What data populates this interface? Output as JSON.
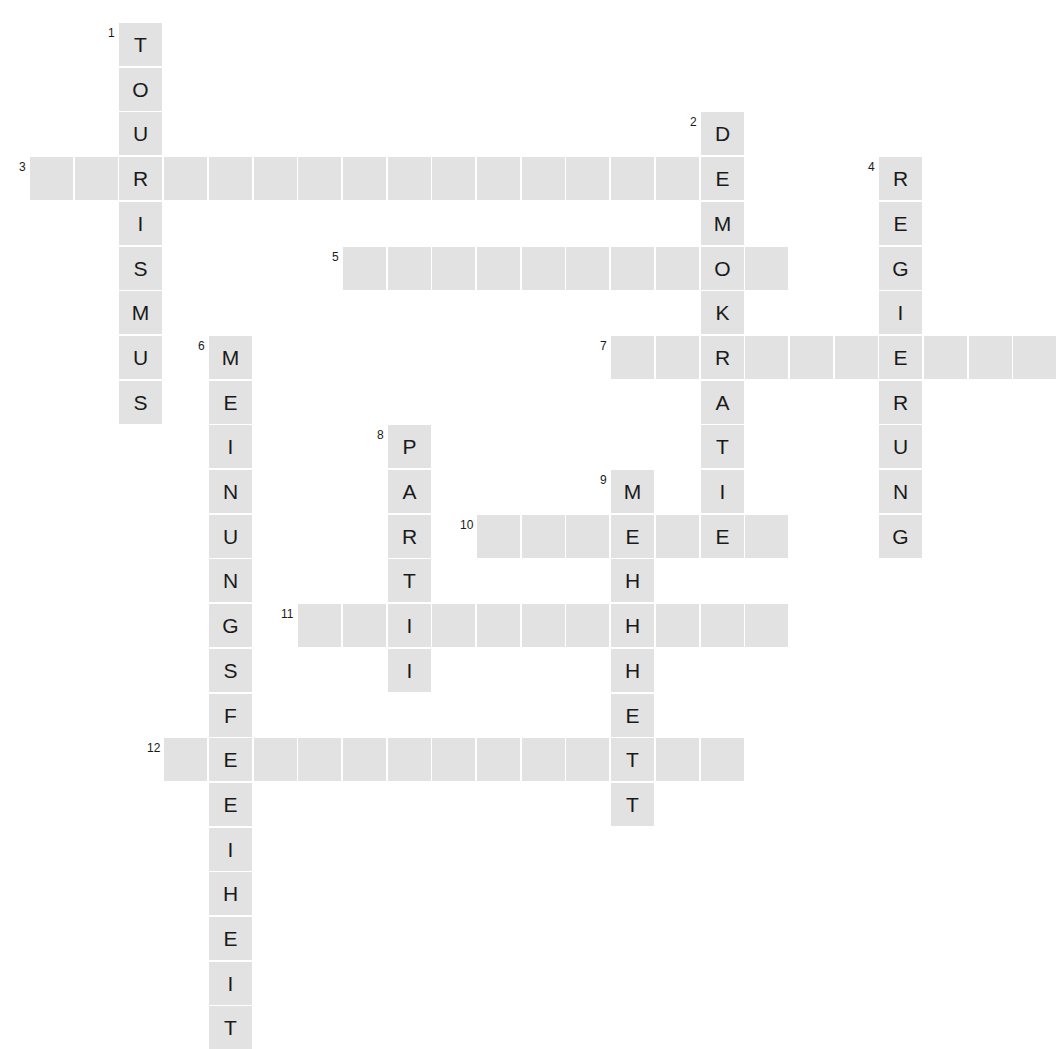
{
  "puzzle": {
    "kind": "crossword-grid",
    "language": "de",
    "cell_size_px": 43,
    "cell_pitch_px": 44.7,
    "origin_x_px": 30,
    "origin_y_px": 23,
    "cell_fill_color": "#e2e2e2",
    "background_color": "#ffffff",
    "letter_color": "#1a1a1a",
    "number_color": "#1a1a1a"
  },
  "entries": [
    {
      "number": "1",
      "direction": "down",
      "row": 0,
      "col": 2,
      "length": 9,
      "letters": [
        "T",
        "O",
        "U",
        "R",
        "I",
        "S",
        "M",
        "U",
        "S"
      ]
    },
    {
      "number": "2",
      "direction": "down",
      "row": 2,
      "col": 15,
      "length": 10,
      "letters": [
        "D",
        "E",
        "M",
        "O",
        "K",
        "R",
        "A",
        "T",
        "I",
        "E"
      ]
    },
    {
      "number": "3",
      "direction": "across",
      "row": 3,
      "col": 0,
      "length": 16,
      "letters": [
        "",
        "",
        "R",
        "",
        "",
        "",
        "",
        "",
        "",
        "",
        "",
        "",
        "",
        "",
        "",
        "E"
      ]
    },
    {
      "number": "4",
      "direction": "down",
      "row": 3,
      "col": 19,
      "length": 9,
      "letters": [
        "R",
        "E",
        "G",
        "I",
        "E",
        "R",
        "U",
        "N",
        "G"
      ]
    },
    {
      "number": "5",
      "direction": "across",
      "row": 5,
      "col": 7,
      "length": 10,
      "letters": [
        "",
        "",
        "",
        "",
        "",
        "",
        "",
        "",
        "O",
        ""
      ]
    },
    {
      "number": "6",
      "direction": "down",
      "row": 7,
      "col": 4,
      "length": 16,
      "letters": [
        "M",
        "E",
        "I",
        "N",
        "U",
        "N",
        "G",
        "S",
        "F",
        "R",
        "E",
        "I",
        "H",
        "E",
        "I",
        "T"
      ]
    },
    {
      "number": "7",
      "direction": "across",
      "row": 7,
      "col": 13,
      "length": 10,
      "letters": [
        "",
        "",
        "R",
        "",
        "",
        "",
        "E",
        "",
        "",
        ""
      ]
    },
    {
      "number": "8",
      "direction": "down",
      "row": 9,
      "col": 8,
      "length": 6,
      "letters": [
        "P",
        "A",
        "R",
        "T",
        "E",
        "I"
      ]
    },
    {
      "number": "9",
      "direction": "down",
      "row": 10,
      "col": 13,
      "length": 8,
      "letters": [
        "M",
        "E",
        "H",
        "R",
        "H",
        "E",
        "I",
        "T"
      ]
    },
    {
      "number": "10",
      "direction": "across",
      "row": 11,
      "col": 10,
      "length": 7,
      "letters": [
        "",
        "",
        "",
        "E",
        "",
        "E",
        ""
      ]
    },
    {
      "number": "11",
      "direction": "across",
      "row": 13,
      "col": 6,
      "length": 11,
      "letters": [
        "",
        "",
        "I",
        "",
        "",
        "",
        "",
        "H",
        "",
        "",
        ""
      ]
    },
    {
      "number": "12",
      "direction": "across",
      "row": 16,
      "col": 3,
      "length": 13,
      "letters": [
        "",
        "E",
        "",
        "",
        "",
        "",
        "",
        "",
        "",
        "",
        "T",
        "",
        ""
      ]
    }
  ]
}
